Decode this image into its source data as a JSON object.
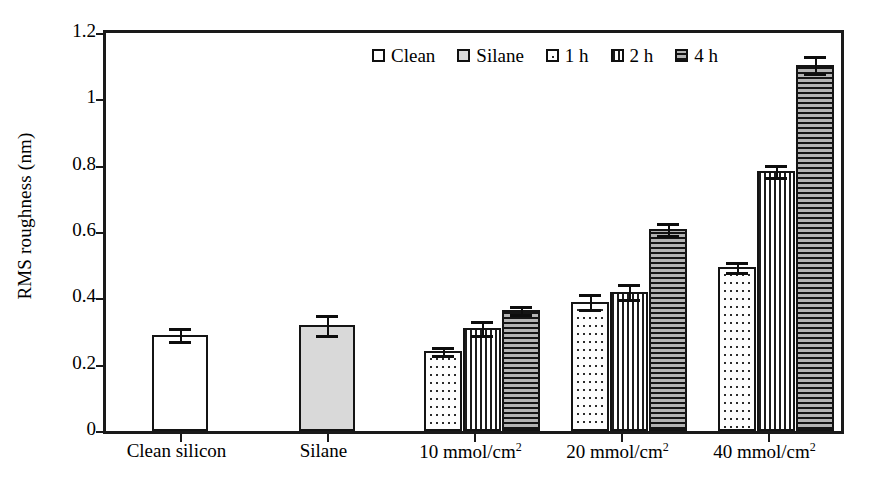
{
  "chart_data": {
    "type": "bar",
    "title": "",
    "xlabel": "",
    "ylabel": "RMS roughness (nm)",
    "ylim": [
      0,
      1.2
    ],
    "yticks": [
      "0",
      "0.2",
      "0.4",
      "0.6",
      "0.8",
      "1",
      "1.2"
    ],
    "ytick_values": [
      0,
      0.2,
      0.4,
      0.6,
      0.8,
      1.0,
      1.2
    ],
    "grid": false,
    "legend_position": "top-center",
    "categories": [
      "Clean silicon",
      "Silane",
      "10 mmol/cm²",
      "20 mmol/cm²",
      "40 mmol/cm²"
    ],
    "legend": [
      "Clean",
      "Silane",
      "1 h",
      "2 h",
      "4 h"
    ],
    "series": [
      {
        "name": "Clean",
        "pattern": "empty",
        "values": [
          0.29,
          null,
          null,
          null,
          null
        ],
        "errors": [
          0.02,
          null,
          null,
          null,
          null
        ]
      },
      {
        "name": "Silane",
        "pattern": "solid-gray",
        "values": [
          null,
          0.32,
          null,
          null,
          null
        ],
        "errors": [
          null,
          0.03,
          null,
          null,
          null
        ]
      },
      {
        "name": "1 h",
        "pattern": "dotted",
        "values": [
          null,
          null,
          0.24,
          0.39,
          0.495
        ],
        "errors": [
          null,
          null,
          0.012,
          0.022,
          0.015
        ]
      },
      {
        "name": "2 h",
        "pattern": "vertical-lines",
        "values": [
          null,
          null,
          0.31,
          0.42,
          0.785
        ],
        "errors": [
          null,
          null,
          0.022,
          0.022,
          0.018
        ]
      },
      {
        "name": "4 h",
        "pattern": "horizontal-lines",
        "values": [
          null,
          null,
          0.365,
          0.61,
          1.105
        ],
        "errors": [
          null,
          null,
          0.012,
          0.018,
          0.025
        ]
      }
    ]
  },
  "colors": {
    "axis": "#1a1a1a",
    "bar_outline": "#141414",
    "clean_fill": "#ffffff",
    "silane_fill": "#d9d9d9",
    "hatch_dark": "#141414",
    "background": "#ffffff"
  },
  "axis": {
    "ylabel": "RMS roughness (nm)",
    "ytick_0": "0",
    "ytick_1": "0.2",
    "ytick_2": "0.4",
    "ytick_3": "0.6",
    "ytick_4": "0.8",
    "ytick_5": "1",
    "ytick_6": "1.2"
  },
  "legend": {
    "items": [
      {
        "label": "Clean",
        "swatch": "swatch-empty-icon"
      },
      {
        "label": "Silane",
        "swatch": "swatch-gray-icon"
      },
      {
        "label": "1 h",
        "swatch": "swatch-dotted-icon"
      },
      {
        "label": "2 h",
        "swatch": "swatch-vertical-icon"
      },
      {
        "label": "4 h",
        "swatch": "swatch-horizontal-icon"
      }
    ]
  },
  "xcategories": [
    {
      "label_plain": "Clean silicon",
      "base": "Clean silicon",
      "sup": ""
    },
    {
      "label_plain": "Silane",
      "base": "Silane",
      "sup": ""
    },
    {
      "label_plain": "10 mmol/cm2",
      "base": "10 mmol/cm",
      "sup": "2"
    },
    {
      "label_plain": "20 mmol/cm2",
      "base": "20 mmol/cm",
      "sup": "2"
    },
    {
      "label_plain": "40 mmol/cm2",
      "base": "40 mmol/cm",
      "sup": "2"
    }
  ]
}
